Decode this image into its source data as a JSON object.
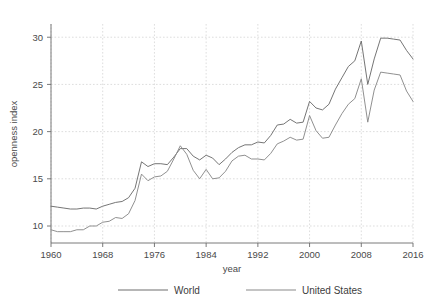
{
  "chart_data": {
    "type": "line",
    "title": "",
    "xlabel": "year",
    "ylabel": "openness index",
    "xlim": [
      1960,
      2016
    ],
    "ylim": [
      8.2,
      31.4
    ],
    "xticks": [
      1960,
      1968,
      1976,
      1984,
      1992,
      2000,
      2008,
      2016
    ],
    "yticks": [
      10,
      15,
      20,
      25,
      30
    ],
    "grid": true,
    "legend_position": "bottom",
    "x": [
      1960,
      1961,
      1962,
      1963,
      1964,
      1965,
      1966,
      1967,
      1968,
      1969,
      1970,
      1971,
      1972,
      1973,
      1974,
      1975,
      1976,
      1977,
      1978,
      1979,
      1980,
      1981,
      1982,
      1983,
      1984,
      1985,
      1986,
      1987,
      1988,
      1989,
      1990,
      1991,
      1992,
      1993,
      1994,
      1995,
      1996,
      1997,
      1998,
      1999,
      2000,
      2001,
      2002,
      2003,
      2004,
      2005,
      2006,
      2007,
      2008,
      2009,
      2010,
      2011,
      2012,
      2013,
      2014,
      2015,
      2016
    ],
    "series": [
      {
        "name": "World",
        "color": "#6e6e6e",
        "values": [
          12.1,
          12.0,
          11.9,
          11.8,
          11.8,
          11.9,
          11.9,
          11.8,
          12.1,
          12.3,
          12.5,
          12.6,
          13.0,
          14.0,
          16.8,
          16.3,
          16.6,
          16.6,
          16.5,
          17.3,
          18.2,
          18.2,
          17.4,
          17.0,
          17.5,
          17.2,
          16.5,
          17.1,
          17.8,
          18.3,
          18.6,
          18.6,
          18.9,
          18.8,
          19.6,
          20.7,
          20.8,
          21.3,
          20.9,
          21.0,
          23.2,
          22.5,
          22.3,
          22.9,
          24.5,
          25.7,
          26.9,
          27.5,
          29.6,
          25.0,
          27.7,
          29.9,
          29.9,
          29.8,
          29.7,
          28.6,
          27.7
        ]
      },
      {
        "name": "United States",
        "color": "#8a8a8a",
        "values": [
          9.6,
          9.4,
          9.4,
          9.4,
          9.6,
          9.6,
          10.0,
          10.0,
          10.4,
          10.5,
          10.9,
          10.8,
          11.3,
          12.7,
          15.5,
          14.8,
          15.2,
          15.3,
          15.8,
          17.1,
          18.5,
          17.6,
          15.9,
          15.0,
          16.0,
          15.0,
          15.1,
          15.8,
          16.9,
          17.4,
          17.5,
          17.1,
          17.1,
          17.0,
          17.7,
          18.7,
          19.0,
          19.4,
          19.1,
          19.2,
          21.7,
          20.1,
          19.3,
          19.4,
          20.7,
          21.9,
          22.9,
          23.5,
          25.6,
          21.0,
          24.4,
          26.3,
          26.2,
          26.1,
          26.0,
          24.3,
          23.2
        ]
      }
    ]
  },
  "legend": {
    "items": [
      {
        "label": "World"
      },
      {
        "label": "United States"
      }
    ]
  },
  "axes": {
    "y_title": "openness index",
    "x_title": "year",
    "y_tick_labels": [
      "10",
      "15",
      "20",
      "25",
      "30"
    ],
    "x_tick_labels": [
      "1960",
      "1968",
      "1976",
      "1984",
      "1992",
      "2000",
      "2008",
      "2016"
    ]
  },
  "colors": {
    "world_line": "#6e6e6e",
    "us_line": "#8a8a8a",
    "grid": "#cfcfcf",
    "axis": "#6b6b6b",
    "text": "#3d3d3d",
    "background": "#ffffff"
  }
}
